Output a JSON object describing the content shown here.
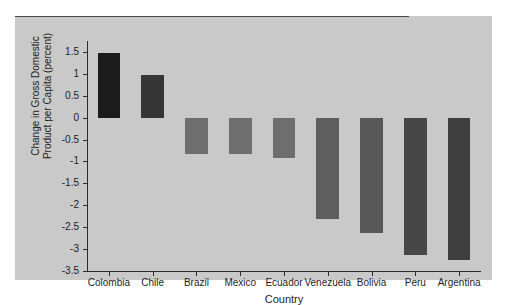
{
  "chart_data": {
    "type": "bar",
    "title": "",
    "xlabel": "Country",
    "ylabel": "Change in Gross Domestic Product per Capita (percent)",
    "ylabel_line1": "Change in Gross Domestic",
    "ylabel_line2": "Product per Capita (percent)",
    "categories": [
      "Colombia",
      "Chile",
      "Brazil",
      "Mexico",
      "Ecuador",
      "Venezuela",
      "Bolivia",
      "Peru",
      "Argentina"
    ],
    "values": [
      1.47,
      0.97,
      -0.83,
      -0.83,
      -0.92,
      -2.32,
      -2.63,
      -3.13,
      -3.24
    ],
    "ylim": [
      -3.5,
      1.75
    ],
    "yticks": [
      1.5,
      1,
      0.5,
      0,
      -0.5,
      -1,
      -1.5,
      -2,
      -2.5,
      -3,
      -3.5
    ],
    "ytick_labels": [
      "1.5",
      "1",
      "0.5",
      "0",
      "-0.5",
      "-1",
      "-1.5",
      "-2",
      "-2.5",
      "-3",
      "-3.5"
    ],
    "grid": false,
    "legend": null,
    "bar_colors": [
      "#1c1c1c",
      "#353535",
      "#6e6e6e",
      "#6e6e6e",
      "#6e6e6e",
      "#5e5e5e",
      "#585858",
      "#474747",
      "#3f3f3f"
    ],
    "panel_color": "#c9c9c9",
    "axis_color": "#2b2b2b",
    "zero_line_color": "#4a4a4a"
  }
}
